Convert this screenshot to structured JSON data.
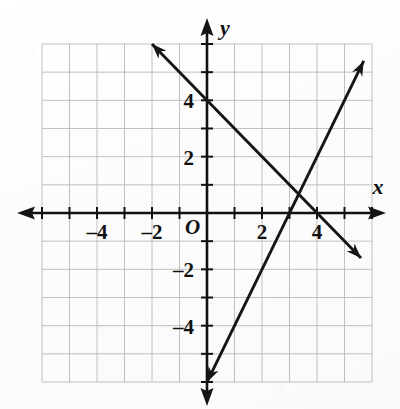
{
  "figure": {
    "kind": "coordinate-plane-graph",
    "background_color": "#fdfdfd",
    "ink_color": "#151515",
    "grid_color": "#b9b9b9",
    "axis_color": "#111111",
    "origin_label": "O",
    "x_axis_name": "x",
    "y_axis_name": "y"
  },
  "chart_data": {
    "type": "line",
    "title": "",
    "subtitle": "",
    "xlabel": "x",
    "ylabel": "y",
    "xlim": [
      -6,
      6
    ],
    "ylim": [
      -6,
      6
    ],
    "grid": true,
    "grid_step": 1,
    "legend": "none",
    "origin_label": "O",
    "x_ticks": [
      -6,
      -5,
      -4,
      -3,
      -2,
      -1,
      0,
      1,
      2,
      3,
      4,
      5,
      6
    ],
    "y_ticks": [
      -6,
      -5,
      -4,
      -3,
      -2,
      -1,
      0,
      1,
      2,
      3,
      4,
      5,
      6
    ],
    "x_tick_labels": [
      {
        "value": -4,
        "text": "–4"
      },
      {
        "value": -2,
        "text": "–2"
      },
      {
        "value": 2,
        "text": "2"
      },
      {
        "value": 4,
        "text": "4"
      }
    ],
    "y_tick_labels": [
      {
        "value": 4,
        "text": "4"
      },
      {
        "value": 2,
        "text": "2"
      },
      {
        "value": -2,
        "text": "–2"
      },
      {
        "value": -4,
        "text": "–4"
      }
    ],
    "series": [
      {
        "name": "descending-line",
        "description": "line falling left-to-right through the y-intercept",
        "slope": -1,
        "y_intercept": 4,
        "x_intercept": 4,
        "points": [
          [
            -2,
            6
          ],
          [
            0,
            4
          ],
          [
            4,
            0
          ],
          [
            5.6,
            -1.6
          ]
        ],
        "arrows": [
          "start",
          "end"
        ],
        "color": "#151515"
      },
      {
        "name": "ascending-line",
        "description": "steep line rising left-to-right",
        "slope": 2,
        "y_intercept": -6,
        "x_intercept": 3,
        "points": [
          [
            0,
            -6
          ],
          [
            3,
            0
          ],
          [
            5.7,
            5.4
          ]
        ],
        "arrows": [
          "start",
          "end"
        ],
        "color": "#151515"
      }
    ],
    "intersection": {
      "x": 3.33,
      "y": 0.67
    },
    "annotations": []
  }
}
